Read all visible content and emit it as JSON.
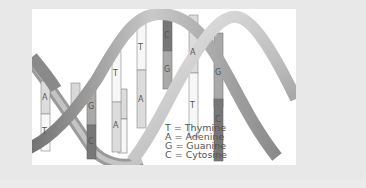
{
  "diagram": {
    "base_pairs": [
      {
        "top": "A",
        "bottom": "T"
      },
      {
        "top": "G",
        "bottom": "C"
      },
      {
        "top": "T",
        "bottom": "A"
      },
      {
        "top": "T",
        "bottom": "A"
      },
      {
        "top": "C",
        "bottom": "G"
      },
      {
        "top": "A",
        "bottom": "T"
      },
      {
        "top": "G",
        "bottom": "C"
      }
    ],
    "legend": [
      "T = Thymine",
      "A = Adenine",
      "G = Guanine",
      "C = Cytosine"
    ],
    "colors": {
      "background": "#e8e8e8",
      "panel": "#ffffff",
      "strand_dark": "#8a8a8a",
      "strand_light": "#d6d6d6",
      "base_C": "#777777",
      "base_G": "#a9a9a9",
      "base_A": "#dcdcdc",
      "base_T": "#f7f7f7"
    }
  }
}
